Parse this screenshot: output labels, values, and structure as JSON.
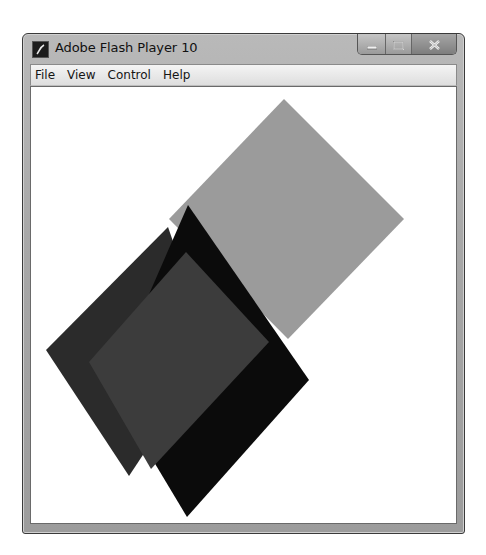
{
  "window": {
    "title": "Adobe Flash Player 10",
    "app_icon": "flash-player-icon",
    "caption_buttons": [
      {
        "name": "minimize",
        "icon": "minimize-icon"
      },
      {
        "name": "maximize",
        "icon": "maximize-icon"
      },
      {
        "name": "close",
        "icon": "close-icon"
      }
    ]
  },
  "menubar": {
    "items": [
      {
        "label": "File"
      },
      {
        "label": "View"
      },
      {
        "label": "Control"
      },
      {
        "label": "Help"
      }
    ]
  },
  "stage": {
    "background": "#ffffff",
    "shapes": [
      {
        "name": "light-gray-square",
        "fill": "#9b9b9b",
        "points": "253,12 373,132 257,252 138,132"
      },
      {
        "name": "dark-gray-square",
        "fill": "#2b2b2b",
        "points": "137,140 15,263 98,389 180,265"
      },
      {
        "name": "black-square",
        "fill": "#0b0b0b",
        "points": "157,118 278,293 156,430 120,370 95,260"
      },
      {
        "name": "charcoal-square",
        "fill": "#3c3c3c",
        "points": "155,165 238,255 120,382 58,275"
      }
    ]
  }
}
